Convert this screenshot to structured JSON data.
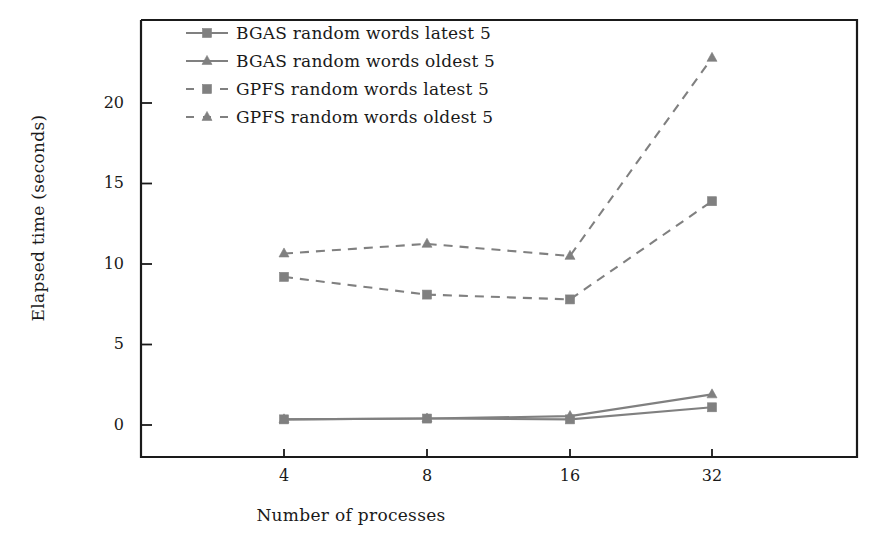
{
  "chart_data": {
    "type": "line",
    "title": "",
    "xlabel": "Number of processes",
    "ylabel": "Elapsed time (seconds)",
    "categories": [
      "4",
      "8",
      "16",
      "32"
    ],
    "x": [
      4,
      8,
      16,
      32
    ],
    "xtick_labels": [
      "4",
      "8",
      "16",
      "32"
    ],
    "ytick_labels": [
      "0",
      "5",
      "10",
      "15",
      "20"
    ],
    "yticks": [
      0,
      5,
      10,
      15,
      20
    ],
    "ylim": [
      -1.5,
      24.2
    ],
    "grid": false,
    "legend_position": "top-left-inside",
    "series": [
      {
        "name": "BGAS random words latest 5",
        "values": [
          0.35,
          0.4,
          0.35,
          1.1
        ],
        "linestyle": "solid",
        "marker": "square",
        "color": "#808080"
      },
      {
        "name": "BGAS random words oldest 5",
        "values": [
          0.35,
          0.4,
          0.55,
          1.9
        ],
        "linestyle": "solid",
        "marker": "triangle",
        "color": "#808080"
      },
      {
        "name": "GPFS random words latest 5",
        "values": [
          9.2,
          8.1,
          7.8,
          13.9
        ],
        "linestyle": "dashed",
        "marker": "square",
        "color": "#808080"
      },
      {
        "name": "GPFS random words oldest 5",
        "values": [
          10.65,
          11.25,
          10.5,
          22.8
        ],
        "linestyle": "dashed",
        "marker": "triangle",
        "color": "#808080"
      }
    ]
  },
  "legend": {
    "items": [
      {
        "label": "BGAS random words latest 5"
      },
      {
        "label": "BGAS random words oldest 5"
      },
      {
        "label": "GPFS random words latest 5"
      },
      {
        "label": "GPFS random words oldest 5"
      }
    ]
  },
  "axes": {
    "x_title": "Number of processes",
    "y_title": "Elapsed time (seconds)",
    "ytick_0": "0",
    "ytick_1": "5",
    "ytick_2": "10",
    "ytick_3": "15",
    "ytick_4": "20",
    "xtick_0": "4",
    "xtick_1": "8",
    "xtick_2": "16",
    "xtick_3": "32"
  },
  "colors": {
    "line": "#808080",
    "axis": "#1a1a1a",
    "text": "#1a1a1a",
    "background": "#ffffff"
  }
}
